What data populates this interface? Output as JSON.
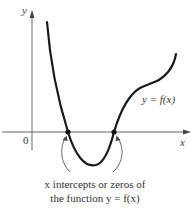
{
  "figure": {
    "axes": {
      "x_label": "x",
      "y_label": "y",
      "origin_label": "0"
    },
    "curve_label": "y = f(x)",
    "caption_line1": "x intercepts or zeros of",
    "caption_line2": "the function y = f(x)",
    "colors": {
      "curve": "#1a1a1a",
      "axes": "#555555",
      "text": "#333333"
    }
  }
}
